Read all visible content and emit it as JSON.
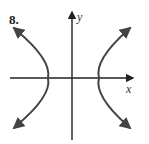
{
  "problem_number": "8.",
  "axes": {
    "x_label": "x",
    "y_label": "y"
  },
  "curve": {
    "type": "hyperbola",
    "orientation": "horizontal",
    "description": "Hyperbola opening left and right, centered at origin, with arrows on all four branch ends"
  },
  "colors": {
    "curve": "#444444",
    "axes": "#222222"
  }
}
